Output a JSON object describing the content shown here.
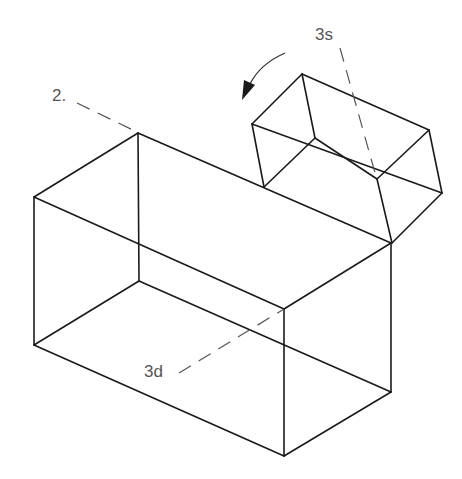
{
  "diagram": {
    "title": "",
    "labels": {
      "view_2": "2.",
      "view_3s": "3s",
      "view_3d": "3d"
    },
    "colors": {
      "edge": "#1a1a1a",
      "leader": "#555555",
      "background": "#ffffff"
    },
    "elements": {
      "large_box": "isometric rectangular block (wireframe)",
      "small_box": "isometric rectangular block tilted on top-right edge of large box",
      "rotation_arrow": "curved arrow indicating rotation (counter-clockwise)"
    }
  }
}
